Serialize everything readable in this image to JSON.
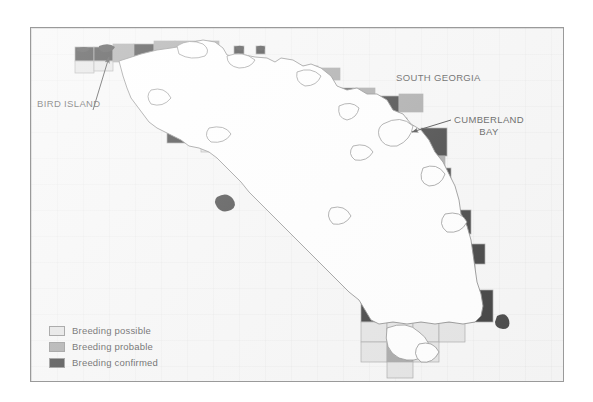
{
  "figure": {
    "kind": "distribution-map",
    "region": "South Georgia",
    "background_color": "#f4f4f4",
    "frame_color": "#9a9a9a"
  },
  "labels": {
    "south_georgia": "SOUTH GEORGIA",
    "bird_island": "BIRD ISLAND",
    "cumberland_bay_line1": "CUMBERLAND",
    "cumberland_bay_line2": "BAY"
  },
  "legend": {
    "items": [
      {
        "label": "Breeding possible",
        "color": "#dcdcdc",
        "status": "possible"
      },
      {
        "label": "Breeding probable",
        "color": "#8c8c8c",
        "status": "probable"
      },
      {
        "label": "Breeding confirmed",
        "color": "#000000",
        "status": "confirmed"
      }
    ]
  },
  "map": {
    "land_fill": "#ffffff",
    "coast_stroke": "#5a5a5a",
    "grid_stroke": "#9a9a9a",
    "annotation_stroke": "#111111"
  }
}
